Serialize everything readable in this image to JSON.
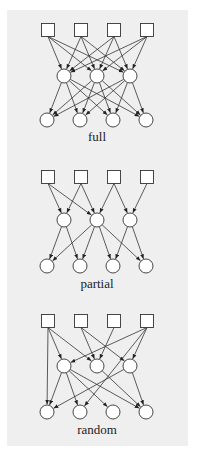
{
  "colors": {
    "background": "#ffffff",
    "panel": "#efefef",
    "node_fill": "#ffffff",
    "stroke": "#333333"
  },
  "layout": {
    "square_x": [
      48,
      81,
      114,
      147
    ],
    "middle_x": [
      64,
      97,
      130
    ],
    "bottom_x": [
      47,
      80,
      113,
      146
    ],
    "square_size": 13,
    "circle_r": 7
  },
  "panels": [
    {
      "label": "full",
      "y_square": 30,
      "y_middle": 76,
      "y_bottom": 120,
      "y_label": 141,
      "edges": [
        [
          "s0",
          "m0"
        ],
        [
          "s0",
          "m1"
        ],
        [
          "s0",
          "m2"
        ],
        [
          "s1",
          "m0"
        ],
        [
          "s1",
          "m1"
        ],
        [
          "s1",
          "m2"
        ],
        [
          "s2",
          "m0"
        ],
        [
          "s2",
          "m1"
        ],
        [
          "s2",
          "m2"
        ],
        [
          "s3",
          "m0"
        ],
        [
          "s3",
          "m1"
        ],
        [
          "s3",
          "m2"
        ],
        [
          "m0",
          "b0"
        ],
        [
          "m0",
          "b1"
        ],
        [
          "m0",
          "b2"
        ],
        [
          "m0",
          "b3"
        ],
        [
          "m1",
          "b0"
        ],
        [
          "m1",
          "b1"
        ],
        [
          "m1",
          "b2"
        ],
        [
          "m1",
          "b3"
        ],
        [
          "m2",
          "b0"
        ],
        [
          "m2",
          "b1"
        ],
        [
          "m2",
          "b2"
        ],
        [
          "m2",
          "b3"
        ]
      ]
    },
    {
      "label": "partial",
      "y_square": 177,
      "y_middle": 220,
      "y_bottom": 266,
      "y_label": 288,
      "edges": [
        [
          "s0",
          "m0"
        ],
        [
          "s0",
          "m1"
        ],
        [
          "s1",
          "m0"
        ],
        [
          "s1",
          "m1"
        ],
        [
          "s2",
          "m1"
        ],
        [
          "s2",
          "m2"
        ],
        [
          "s3",
          "m2"
        ],
        [
          "m0",
          "b0"
        ],
        [
          "m0",
          "b1"
        ],
        [
          "m1",
          "b0"
        ],
        [
          "m1",
          "b1"
        ],
        [
          "m1",
          "b2"
        ],
        [
          "m1",
          "b3"
        ],
        [
          "m2",
          "b2"
        ],
        [
          "m2",
          "b3"
        ]
      ]
    },
    {
      "label": "random",
      "y_square": 321,
      "y_middle": 366,
      "y_bottom": 412,
      "y_label": 434,
      "edges": [
        [
          "s0",
          "m0"
        ],
        [
          "s0",
          "b0"
        ],
        [
          "s0",
          "m1"
        ],
        [
          "s1",
          "m1"
        ],
        [
          "s1",
          "m2"
        ],
        [
          "s2",
          "m1"
        ],
        [
          "s3",
          "m0"
        ],
        [
          "s3",
          "m2"
        ],
        [
          "s3",
          "b1"
        ],
        [
          "m0",
          "b0"
        ],
        [
          "m0",
          "b1"
        ],
        [
          "m0",
          "b2"
        ],
        [
          "m0",
          "b3"
        ],
        [
          "m1",
          "b3"
        ],
        [
          "m2",
          "b0"
        ],
        [
          "m2",
          "b3"
        ]
      ]
    }
  ]
}
